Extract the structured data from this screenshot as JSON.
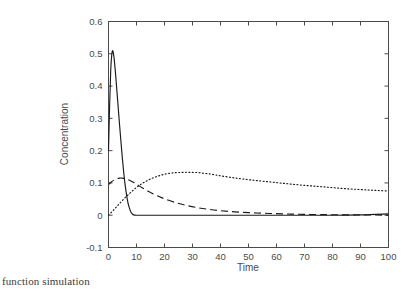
{
  "figure": {
    "caption": "function simulation",
    "background_color": "#ffffff",
    "axis_color": "#4a4a4a",
    "curve_color": "#1a1a1a"
  },
  "chart_data": {
    "type": "line",
    "title": "",
    "subtitle": "",
    "xlabel": "Time",
    "ylabel": "Concentration",
    "xlim": [
      0,
      100
    ],
    "ylim": [
      -0.1,
      0.6
    ],
    "xticks": [
      0,
      10,
      20,
      30,
      40,
      50,
      60,
      70,
      80,
      90,
      100
    ],
    "xtick_labels": [
      "0",
      "10",
      "20",
      "30",
      "40",
      "50",
      "60",
      "70",
      "80",
      "90",
      "100"
    ],
    "yticks": [
      -0.1,
      0,
      0.1,
      0.2,
      0.3,
      0.4,
      0.5,
      0.6
    ],
    "ytick_labels": [
      "-0.1",
      "0",
      "0.1",
      "0.2",
      "0.3",
      "0.4",
      "0.5",
      "0.6"
    ],
    "grid": false,
    "legend": "none",
    "legend_position": "none",
    "annotations": [],
    "series": [
      {
        "name": "solid",
        "style": "solid",
        "color": "#1a1a1a",
        "x": [
          0,
          0.4,
          0.8,
          1.2,
          1.5,
          1.8,
          2.1,
          2.5,
          3,
          3.5,
          4,
          4.5,
          5,
          5.5,
          6,
          6.5,
          7,
          7.5,
          8,
          8.5,
          9,
          10,
          12,
          15,
          20,
          30,
          40,
          50,
          60,
          70,
          80,
          90,
          100
        ],
        "y": [
          0.2,
          0.34,
          0.45,
          0.5,
          0.51,
          0.5,
          0.478,
          0.44,
          0.385,
          0.33,
          0.275,
          0.222,
          0.172,
          0.127,
          0.09,
          0.06,
          0.037,
          0.021,
          0.01,
          0.004,
          0.001,
          0,
          0,
          0,
          0,
          0,
          0,
          0,
          0,
          0,
          0,
          0.001,
          0.004
        ]
      },
      {
        "name": "dashed",
        "style": "dashed",
        "color": "#1a1a1a",
        "x": [
          0,
          1,
          2,
          3,
          4,
          5,
          6,
          7,
          8,
          9,
          10,
          12,
          14,
          16,
          18,
          20,
          24,
          28,
          32,
          36,
          40,
          45,
          50,
          55,
          60,
          65,
          70,
          75,
          80,
          90,
          100
        ],
        "y": [
          0.095,
          0.103,
          0.109,
          0.113,
          0.115,
          0.115,
          0.113,
          0.11,
          0.106,
          0.101,
          0.096,
          0.085,
          0.075,
          0.066,
          0.058,
          0.051,
          0.039,
          0.03,
          0.023,
          0.018,
          0.014,
          0.0105,
          0.008,
          0.0062,
          0.0048,
          0.0035,
          0.0025,
          0.002,
          0.0015,
          0.0008,
          0.0004
        ]
      },
      {
        "name": "dotted",
        "style": "dotted",
        "color": "#1a1a1a",
        "x": [
          0,
          2,
          4,
          6,
          8,
          10,
          12,
          14,
          16,
          18,
          20,
          22,
          24,
          26,
          28,
          30,
          32,
          34,
          36,
          38,
          40,
          45,
          50,
          55,
          60,
          65,
          70,
          75,
          80,
          85,
          90,
          95,
          100
        ],
        "y": [
          0.0,
          0.018,
          0.037,
          0.055,
          0.071,
          0.086,
          0.098,
          0.108,
          0.116,
          0.122,
          0.127,
          0.13,
          0.132,
          0.1325,
          0.133,
          0.1325,
          0.132,
          0.13,
          0.128,
          0.125,
          0.122,
          0.1155,
          0.11,
          0.1055,
          0.101,
          0.0965,
          0.0925,
          0.089,
          0.0855,
          0.082,
          0.0795,
          0.077,
          0.075
        ]
      }
    ]
  }
}
